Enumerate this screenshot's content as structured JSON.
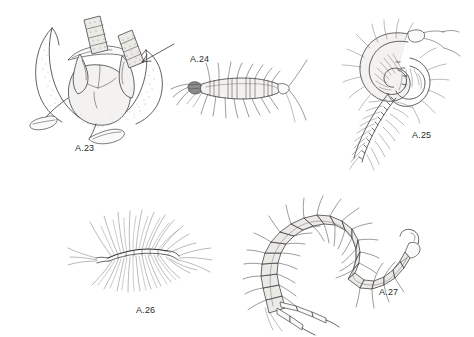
{
  "plate": {
    "background_color": "#ffffff",
    "ink_color": "#3a3a3a",
    "subject": "centipede line drawings",
    "figures": [
      {
        "id": "a23",
        "label": "A.23",
        "caption_x": 75,
        "caption_y": 143,
        "subject": "forcipular segment with venom claws, ventral view",
        "has_arrow": true
      },
      {
        "id": "a24",
        "label": "A.24",
        "caption_x": 190,
        "caption_y": 54,
        "subject": "lithobiomorph centipede, dorsal view"
      },
      {
        "id": "a25",
        "label": "A.25",
        "caption_x": 412,
        "caption_y": 130,
        "subject": "coiled geophilomorph centipede"
      },
      {
        "id": "a26",
        "label": "A.26",
        "caption_x": 136,
        "caption_y": 305,
        "subject": "scutigeromorph house centipede with long legs"
      },
      {
        "id": "a27",
        "label": "A.27",
        "caption_x": 379,
        "caption_y": 287,
        "subject": "curved scolopendromorph centipede with terminal legs"
      }
    ]
  }
}
